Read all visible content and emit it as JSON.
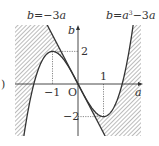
{
  "diagram": {
    "title_left_curve": "b = −3a",
    "title_right_curve": "b = a³ − 3a",
    "label_line": "b=−3a",
    "label_curve_b": "b=a",
    "label_curve_exp": "3",
    "label_curve_tail": "−3a",
    "axis_x_label": "a",
    "axis_y_label": "b",
    "origin_label": "O",
    "tick_labels": {
      "x_neg1": "−1",
      "x_pos1": "1",
      "y_pos2": "2",
      "y_neg2": "−2"
    },
    "side_mark": ")",
    "colors": {
      "line": "#333333",
      "hatch": "#555555",
      "dotted": "#555555",
      "background": "#ffffff"
    }
  }
}
